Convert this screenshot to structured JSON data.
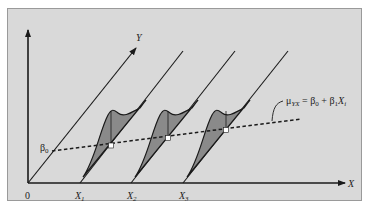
{
  "diagram": {
    "type": "regression-conditional-distributions",
    "colors": {
      "background": "#d9d9d9",
      "frame": "#9a9a9a",
      "line": "#1a1a1a",
      "curve_fill": "#8a8a8a",
      "mean_point": "#ffffff"
    },
    "axes": {
      "origin_label": "0",
      "x_axis_label": "X",
      "y_axis_label": "Y"
    },
    "x_positions": [
      {
        "label": "X",
        "subscript": "1"
      },
      {
        "label": "X",
        "subscript": "2"
      },
      {
        "label": "X",
        "subscript": "3"
      }
    ],
    "intercept_label": {
      "symbol": "β",
      "subscript": "0"
    },
    "regression_line": {
      "style": "dashed",
      "equation": {
        "lhs": "μ",
        "lhs_sub": "YX",
        "eq": " = ",
        "b0": "β",
        "b0_sub": "0",
        "plus": " + ",
        "b1": "β",
        "b1_sub": "1",
        "x": "X",
        "x_sub": "i"
      }
    },
    "distributions_count": 3
  }
}
